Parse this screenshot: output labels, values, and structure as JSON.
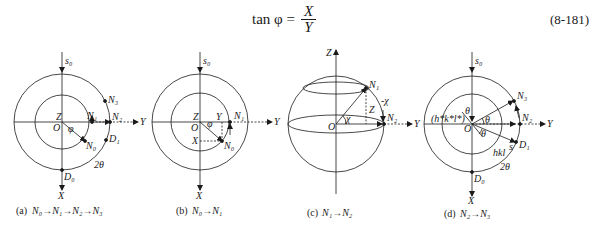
{
  "equation": {
    "lhs": "tan φ =",
    "numerator": "X",
    "denominator": "Y",
    "number": "(8-181)"
  },
  "panels": [
    {
      "id": "a",
      "caption_prefix": "(a)",
      "caption": "N₀→N₁→N₂→N₃",
      "labels": {
        "s0": "s₀",
        "Z": "Z",
        "O": "O",
        "phi": "φ",
        "N0": "N₀",
        "N1": "N₁",
        "N2": "N₂",
        "N3": "N₃",
        "D0": "D₀",
        "D1": "D₁",
        "two_theta": "2θ",
        "X": "X",
        "Y": "Y"
      }
    },
    {
      "id": "b",
      "caption_prefix": "(b)",
      "caption": "N₀→N₁",
      "labels": {
        "s0": "s₀",
        "Z": "Z",
        "O": "O",
        "phi": "φ",
        "Yc": "Y",
        "Xc": "X",
        "N0": "N₀",
        "N1": "N₁",
        "X": "X",
        "Y": "Y"
      }
    },
    {
      "id": "c",
      "caption_prefix": "(c)",
      "caption": "N₁→N₂",
      "labels": {
        "Zaxis": "Z",
        "O": "O",
        "chi": "χ",
        "minus_chi": "-χ",
        "Zc": "Z",
        "N1": "N₁",
        "N2": "N₂",
        "Y": "Y"
      }
    },
    {
      "id": "d",
      "caption_prefix": "(d)",
      "caption": "N₂→N₃",
      "labels": {
        "s0": "s₀",
        "theta_top": "θ",
        "hkl_star": "(h*k*l*)",
        "O": "O",
        "theta1": "θ",
        "theta2": "θ",
        "s": "s",
        "N3": "N₃",
        "N2": "N₂",
        "D1": "D₁",
        "hkl": "hkl",
        "two_theta": "2θ",
        "D0": "D₀",
        "X": "X",
        "Y": "Y"
      }
    }
  ]
}
